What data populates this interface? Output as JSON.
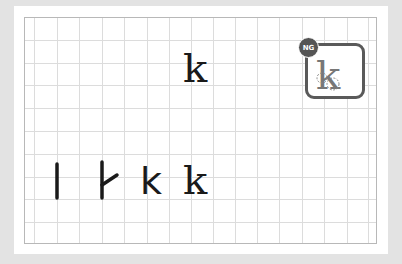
{
  "exercise": {
    "target_letter": "k",
    "stroke_steps": [
      "l",
      "stroke-2",
      "k",
      "k"
    ],
    "result_badge": "NG",
    "result_letter": "k",
    "colors": {
      "background": "#e3e3e3",
      "card": "#ffffff",
      "grid_line": "#dcdcdc",
      "grid_border": "#b8b8b8",
      "ink": "#1a1a1a",
      "ng_badge": "#555555",
      "ng_box_border": "#5a5a5a",
      "attempt_ink": "#777777"
    }
  }
}
